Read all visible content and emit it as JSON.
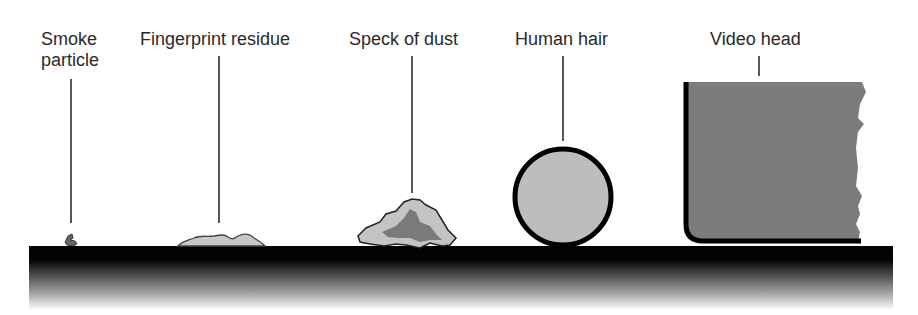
{
  "labels": {
    "smoke_line1": "Smoke",
    "smoke_line2": "particle",
    "fingerprint": "Fingerprint residue",
    "dust": "Speck of dust",
    "hair": "Human hair",
    "video_head": "Video head"
  },
  "colors": {
    "text": "#2a2a2a",
    "leader_line": "#222222",
    "surface_top": "#000000",
    "surface_bottom": "#ffffff",
    "smoke_fill": "#666666",
    "fingerprint_fill": "#c8c8c8",
    "dust_light": "#c4c4c4",
    "dust_dark": "#7a7a7a",
    "hair_fill": "#bdbdbd",
    "hair_outline": "#000000",
    "head_fill": "#7c7c7c",
    "head_outline": "#000000"
  }
}
